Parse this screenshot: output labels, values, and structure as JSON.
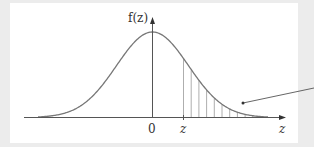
{
  "figure": {
    "y_axis_label": "f(z)",
    "x_axis_label": "z",
    "tick_labels": [
      "0",
      "z"
    ],
    "colors": {
      "curve": "#777777",
      "axis": "#555555",
      "hatch": "#999999",
      "pointer": "#555555",
      "background": "#ececec",
      "panel": "#ffffff"
    }
  },
  "chart_data": {
    "type": "line",
    "title": "",
    "xlabel": "z",
    "ylabel": "f(z)",
    "series": [
      {
        "name": "standard normal density",
        "function": "exp(-z^2/2)/sqrt(2*pi)"
      }
    ],
    "x_range": [
      -3.2,
      3.2
    ],
    "shaded_region": {
      "from": "z",
      "to": "+inf",
      "style": "vertical hatching",
      "z_value_approx": 0.6
    },
    "ticks": [
      {
        "x": 0,
        "label": "0"
      },
      {
        "x": 0.6,
        "label": "z"
      }
    ],
    "annotations": [
      {
        "type": "pointer-line",
        "target": "shaded tail area"
      }
    ],
    "grid": false,
    "legend": null
  }
}
